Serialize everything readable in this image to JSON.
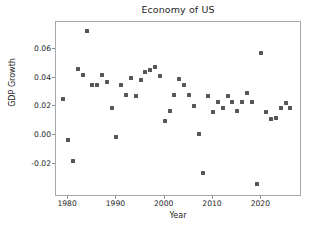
{
  "chart_data": {
    "type": "scatter",
    "title": "Economy of US",
    "xlabel": "Year",
    "ylabel": "GDP Growth",
    "xlim": [
      1977.5,
      2028.0
    ],
    "ylim": [
      -0.0415,
      0.0785
    ],
    "xticks": [
      1980,
      1990,
      2000,
      2010,
      2020
    ],
    "xtick_labels": [
      "1980",
      "1990",
      "2000",
      "2010",
      "2020"
    ],
    "yticks": [
      -0.02,
      0.0,
      0.02,
      0.04,
      0.06
    ],
    "ytick_labels": [
      "-0.02",
      "0.00",
      "0.02",
      "0.04",
      "0.06"
    ],
    "grid": false,
    "legend": null,
    "marker": "square",
    "marker_color": "#555555",
    "marker_size": 4,
    "x": [
      1979,
      1980,
      1981,
      1982,
      1983,
      1984,
      1985,
      1986,
      1987,
      1988,
      1989,
      1990,
      1991,
      1992,
      1993,
      1994,
      1995,
      1996,
      1997,
      1998,
      1999,
      2000,
      2001,
      2002,
      2003,
      2004,
      2005,
      2006,
      2007,
      2008,
      2009,
      2010,
      2011,
      2012,
      2013,
      2014,
      2015,
      2016,
      2017,
      2018,
      2019,
      2020,
      2021,
      2022,
      2023,
      2024,
      2025,
      2026
    ],
    "y": [
      0.025,
      -0.003,
      -0.018,
      0.046,
      0.042,
      0.072,
      0.035,
      0.035,
      0.042,
      0.037,
      0.019,
      -0.001,
      0.035,
      0.028,
      0.04,
      0.027,
      0.038,
      0.044,
      0.045,
      0.047,
      0.041,
      0.01,
      0.017,
      0.028,
      0.039,
      0.035,
      0.028,
      0.02,
      0.001,
      -0.026,
      0.027,
      0.016,
      0.023,
      0.019,
      0.027,
      0.023,
      0.017,
      0.023,
      0.029,
      0.023,
      -0.034,
      0.057,
      0.016,
      0.011,
      0.012,
      0.019,
      0.022,
      0.019
    ],
    "series_name": "GDP Growth"
  }
}
